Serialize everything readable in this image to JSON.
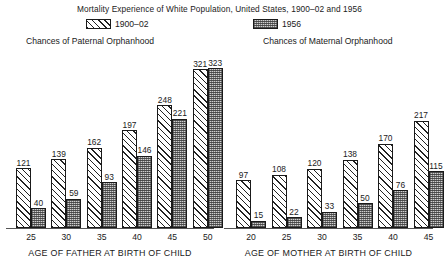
{
  "chart_data": {
    "type": "bar",
    "title": "Mortality Experience of White Population, United States, 1900–02 and 1956",
    "legend": [
      {
        "key": "series1",
        "label": "1900–02",
        "pattern": "diagonal-hatch"
      },
      {
        "key": "series2",
        "label": "1956",
        "pattern": "stipple-grey"
      }
    ],
    "legend_position": "top",
    "grid": false,
    "panels": [
      {
        "id": "paternal",
        "heading": "Chances of Paternal Orphanhood",
        "xlabel": "AGE OF FATHER AT BIRTH OF CHILD",
        "ylabel": "",
        "ylim": [
          0,
          340
        ],
        "categories": [
          "25",
          "30",
          "35",
          "40",
          "45",
          "50"
        ],
        "series": [
          {
            "name": "1900–02",
            "values": [
              121,
              139,
              162,
              197,
              248,
              321
            ]
          },
          {
            "name": "1956",
            "values": [
              40,
              59,
              93,
              146,
              221,
              323
            ]
          }
        ]
      },
      {
        "id": "maternal",
        "heading": "Chances of Maternal Orphanhood",
        "xlabel": "AGE OF MOTHER AT BIRTH OF CHILD",
        "ylabel": "",
        "ylim": [
          0,
          340
        ],
        "categories": [
          "20",
          "25",
          "30",
          "35",
          "40",
          "45"
        ],
        "series": [
          {
            "name": "1900–02",
            "values": [
              97,
              108,
              120,
              138,
              170,
              217
            ]
          },
          {
            "name": "1956",
            "values": [
              15,
              22,
              33,
              50,
              76,
              115
            ]
          }
        ]
      }
    ]
  }
}
